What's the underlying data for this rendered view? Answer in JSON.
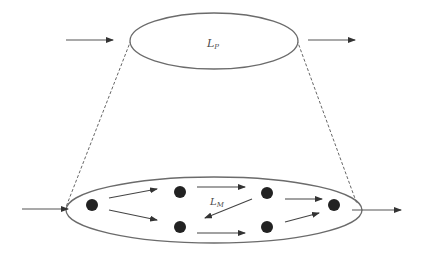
{
  "diagram": {
    "type": "two-level hierarchy diagram",
    "colors": {
      "stroke": "#6b6b6b",
      "node": "#222222",
      "dashed": "#555555",
      "background": "#ffffff"
    },
    "top_layer": {
      "label_main": "L",
      "label_sub": "P",
      "input_arrow": true,
      "output_arrow": true
    },
    "bottom_layer": {
      "label_main": "L",
      "label_sub": "M",
      "node_count": 6,
      "nodes": [
        {
          "id": "n1",
          "x": 92,
          "y": 205
        },
        {
          "id": "n2",
          "x": 180,
          "y": 192
        },
        {
          "id": "n3",
          "x": 180,
          "y": 227
        },
        {
          "id": "n4",
          "x": 267,
          "y": 193
        },
        {
          "id": "n5",
          "x": 267,
          "y": 227
        },
        {
          "id": "n6",
          "x": 334,
          "y": 205
        }
      ],
      "edges": [
        {
          "from": "n1",
          "to": "n2"
        },
        {
          "from": "n1",
          "to": "n3"
        },
        {
          "from": "n2",
          "to": "n4"
        },
        {
          "from": "n4",
          "to": "n3"
        },
        {
          "from": "n3",
          "to": "n5"
        },
        {
          "from": "n4",
          "to": "n6"
        },
        {
          "from": "n5",
          "to": "n6"
        }
      ],
      "input_arrow": true,
      "output_arrow": true
    },
    "connectors": "dashed projection lines from top ellipse edges to bottom ellipse edges"
  }
}
